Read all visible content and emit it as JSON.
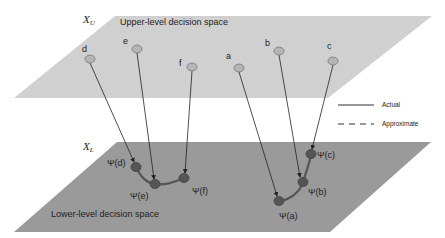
{
  "upper_plane": {
    "symbol": "X",
    "subscript": "U",
    "label": "Upper-level decision space",
    "fill": "#d0d0d0",
    "points": [
      {
        "name": "d",
        "x": 90,
        "y": 59
      },
      {
        "name": "e",
        "x": 137,
        "y": 49
      },
      {
        "name": "f",
        "x": 192,
        "y": 67
      },
      {
        "name": "a",
        "x": 239,
        "y": 68
      },
      {
        "name": "b",
        "x": 279,
        "y": 51
      },
      {
        "name": "c",
        "x": 333,
        "y": 61
      }
    ]
  },
  "lower_plane": {
    "symbol": "X",
    "subscript": "L",
    "label": "Lower-level decision space",
    "fill": "#9a9a9a",
    "points": [
      {
        "name": "Ψ(d)",
        "x": 136,
        "y": 167
      },
      {
        "name": "Ψ(e)",
        "x": 155,
        "y": 184
      },
      {
        "name": "Ψ(f)",
        "x": 184,
        "y": 178
      },
      {
        "name": "Ψ(a)",
        "x": 279,
        "y": 201
      },
      {
        "name": "Ψ(b)",
        "x": 303,
        "y": 182
      },
      {
        "name": "Ψ(c)",
        "x": 311,
        "y": 154
      }
    ]
  },
  "legend": {
    "actual": "Actual",
    "approximate": "Approximate"
  }
}
